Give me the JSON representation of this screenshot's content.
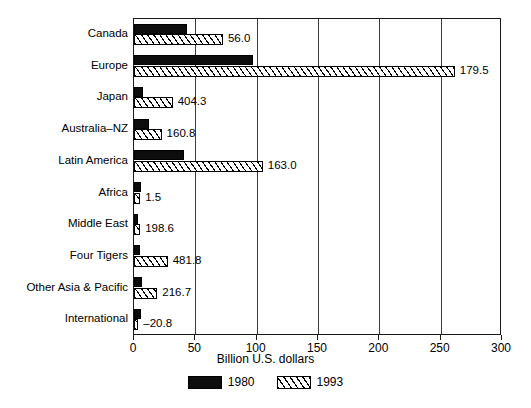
{
  "chart_data": {
    "type": "bar",
    "orientation": "horizontal",
    "title": "",
    "xlabel": "Billion U.S. dollars",
    "ylabel": "",
    "xlim": [
      0,
      300
    ],
    "xticks": [
      0,
      50,
      100,
      150,
      200,
      250,
      300
    ],
    "xtick_labels": [
      "0",
      "50",
      "100",
      "150",
      "200",
      "250",
      "300"
    ],
    "grid": true,
    "grid_axis": "x",
    "legend_position": "bottom",
    "categories": [
      "Canada",
      "Europe",
      "Japan",
      "Australia–NZ",
      "Latin America",
      "Africa",
      "Middle East",
      "Four Tigers",
      "Other Asia & Pacific",
      "International"
    ],
    "series": [
      {
        "name": "1980",
        "style": "solid-black",
        "color": "#0d0d0d",
        "values": [
          43.5,
          97.0,
          7.5,
          12.0,
          40.5,
          6.0,
          3.5,
          5.0,
          6.5,
          6.0
        ]
      },
      {
        "name": "1993",
        "style": "hatched",
        "color": "#ffffff",
        "values": [
          72.5,
          261.5,
          31.5,
          22.5,
          105.0,
          5.0,
          5.0,
          27.5,
          19.0,
          3.5
        ]
      }
    ],
    "bar_labels": [
      "56.0",
      "179.5",
      "404.3",
      "160.8",
      "163.0",
      "1.5",
      "198.6",
      "481.8",
      "216.7",
      "–20.8"
    ],
    "legend": [
      {
        "label": "1980",
        "swatch": "solid-black"
      },
      {
        "label": "1993",
        "swatch": "hatched"
      }
    ]
  },
  "colors": {
    "frame": "#1a1a1a",
    "gridline": "#3a3a3a",
    "series_1980": "#0d0d0d",
    "series_1993_fill": "#ffffff",
    "background": "#ffffff"
  }
}
